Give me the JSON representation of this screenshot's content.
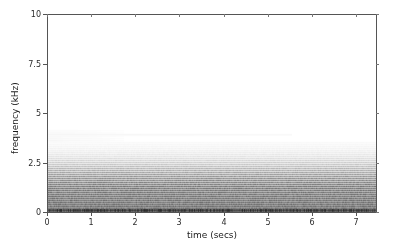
{
  "figure": {
    "background_color": "#ffffff",
    "axes_color": "#555555"
  },
  "axis": {
    "xlabel": "time (secs)",
    "ylabel": "frequency (kHz)",
    "x_ticks": [
      "0",
      "1",
      "2",
      "3",
      "4",
      "5",
      "6",
      "7"
    ],
    "y_ticks": [
      "0",
      "2.5",
      "5",
      "7.5",
      "10"
    ]
  },
  "chart_data": {
    "type": "heatmap",
    "title": "",
    "subtitle": "",
    "xlabel": "time (secs)",
    "ylabel": "frequency (kHz)",
    "xlim": [
      0,
      7.45
    ],
    "ylim": [
      0,
      10
    ],
    "x_ticks": [
      0,
      1,
      2,
      3,
      4,
      5,
      6,
      7
    ],
    "y_ticks": [
      0,
      2.5,
      5,
      7.5,
      10
    ],
    "grid": false,
    "legend": "none",
    "colormap": "grayscale",
    "fundamental_khz": 0.1,
    "harmonic_spacing_khz": 0.1,
    "series": [
      {
        "name": "harmonic-stack",
        "x_start": 0.0,
        "x_end": 7.45,
        "harmonics_khz": [
          0.1,
          0.2,
          0.3,
          0.4,
          0.5,
          0.6,
          0.7,
          0.8,
          0.9,
          1.0,
          1.1,
          1.2,
          1.3,
          1.4,
          1.5,
          1.6,
          1.7,
          1.8,
          1.9,
          2.0,
          2.1,
          2.2,
          2.3,
          2.4,
          2.5,
          2.6,
          2.7,
          2.8,
          2.9,
          3.0,
          3.1,
          3.2,
          3.3,
          3.4,
          3.5
        ],
        "intensities": [
          0.95,
          0.92,
          0.9,
          0.88,
          0.86,
          0.84,
          0.82,
          0.8,
          0.78,
          0.76,
          0.74,
          0.72,
          0.7,
          0.66,
          0.62,
          0.58,
          0.54,
          0.5,
          0.46,
          0.42,
          0.38,
          0.34,
          0.3,
          0.26,
          0.23,
          0.2,
          0.17,
          0.14,
          0.12,
          0.1,
          0.08,
          0.07,
          0.06,
          0.05,
          0.04
        ]
      },
      {
        "name": "partial-upper-harmonic",
        "x_start": 0.0,
        "x_end": 5.55,
        "harmonics_khz": [
          3.9
        ],
        "intensities": [
          0.07
        ]
      },
      {
        "name": "short-onset-partials",
        "x_start": 0.0,
        "x_end": 1.75,
        "harmonics_khz": [
          3.6,
          3.7,
          3.8,
          4.0,
          4.1
        ],
        "intensities": [
          0.06,
          0.06,
          0.05,
          0.05,
          0.04
        ]
      },
      {
        "name": "baseline-noise-floor",
        "x_start": 0.0,
        "x_end": 7.45,
        "harmonics_khz": [
          0.04
        ],
        "intensities": [
          0.55
        ]
      }
    ]
  }
}
